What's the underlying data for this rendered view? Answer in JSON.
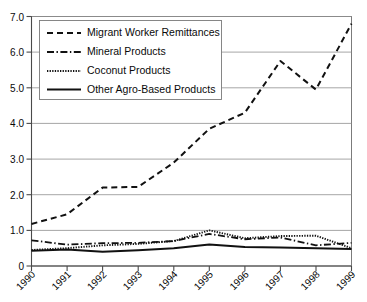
{
  "chart_data": {
    "type": "line",
    "title": "",
    "subtitle": "",
    "xlabel": "",
    "ylabel": "",
    "grid": true,
    "grid_axis": "y",
    "legend_position": "top-left",
    "categories": [
      "1990",
      "1991",
      "1992",
      "1993",
      "1994",
      "1995",
      "1996",
      "1997",
      "1998",
      "1999"
    ],
    "x": [
      1990,
      1991,
      1992,
      1993,
      1994,
      1995,
      1996,
      1997,
      1998,
      1999
    ],
    "xlim": [
      1990,
      1999
    ],
    "ylim": [
      0,
      7.0
    ],
    "ytick_labels": [
      "0",
      "1.0",
      "2.0",
      "3.0",
      "4.0",
      "5.0",
      "6.0",
      "7.0"
    ],
    "ytick_values": [
      0,
      1.0,
      2.0,
      3.0,
      4.0,
      5.0,
      6.0,
      7.0
    ],
    "xtick_labels": [
      "1990",
      "1991",
      "1992",
      "1993",
      "1994",
      "1995",
      "1996",
      "1997",
      "1998",
      "1999"
    ],
    "xtick_rotation": -45,
    "series": [
      {
        "name": "Migrant Worker Remittances",
        "line_style": "dashed",
        "color": "#111111",
        "values": [
          1.18,
          1.45,
          2.2,
          2.22,
          2.9,
          3.85,
          4.3,
          5.75,
          4.95,
          6.8
        ]
      },
      {
        "name": "Mineral Products",
        "line_style": "dash-dot",
        "color": "#111111",
        "values": [
          0.72,
          0.6,
          0.64,
          0.65,
          0.7,
          0.9,
          0.75,
          0.8,
          0.58,
          0.65
        ]
      },
      {
        "name": "Coconut Products",
        "line_style": "dotted",
        "color": "#111111",
        "values": [
          0.45,
          0.5,
          0.58,
          0.62,
          0.7,
          1.0,
          0.78,
          0.84,
          0.85,
          0.5
        ]
      },
      {
        "name": "Other Agro-Based Products",
        "line_style": "solid",
        "color": "#111111",
        "values": [
          0.43,
          0.46,
          0.4,
          0.44,
          0.5,
          0.6,
          0.53,
          0.52,
          0.5,
          0.48
        ]
      }
    ],
    "legend_entries": [
      "Migrant Worker Remittances",
      "Mineral Products",
      "Coconut Products",
      "Other Agro-Based Products"
    ]
  }
}
